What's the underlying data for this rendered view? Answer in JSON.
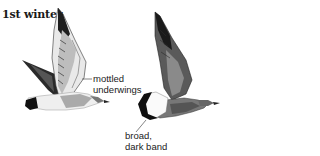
{
  "title": "1st winter",
  "figures": [
    {
      "name": "bird-left",
      "label_lines": [
        "mottled",
        "underwings"
      ]
    },
    {
      "name": "bird-right",
      "label_lines": [
        "broad,",
        "dark band"
      ]
    }
  ]
}
